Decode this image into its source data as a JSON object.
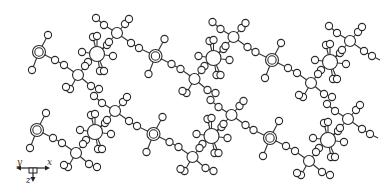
{
  "diagram": {
    "type": "crystal-structure-packing",
    "colors": {
      "stroke": "#2a2a2a",
      "fill": "#ffffff",
      "background": "#ffffff"
    },
    "repeat_offset": {
      "dx": 116.5,
      "dy": 4
    },
    "row_offset": {
      "dx": -2,
      "dy": 78
    },
    "units_per_row": 3,
    "rows": 2,
    "unit": {
      "metal_center": {
        "x": 39,
        "y": 52,
        "r_outer": 6.5,
        "r_inner": 4.2,
        "terminals": [
          {
            "x": 48,
            "y": 35
          },
          {
            "x": 32,
            "y": 70
          }
        ]
      },
      "bridge_to_junction": [
        {
          "x": 55,
          "y": 60
        },
        {
          "x": 64,
          "y": 65
        }
      ],
      "junction_lower": {
        "x": 78,
        "y": 75,
        "r": 5.5,
        "branches": [
          {
            "x": 70,
            "y": 89
          },
          {
            "x": 66,
            "y": 87
          },
          {
            "x": 91,
            "y": 86
          },
          {
            "x": 99,
            "y": 89
          }
        ]
      },
      "octahedral": {
        "x": 97,
        "y": 54,
        "r": 7.5,
        "ligands": [
          {
            "x": 93,
            "y": 37
          },
          {
            "x": 97,
            "y": 36
          },
          {
            "x": 82,
            "y": 52
          },
          {
            "x": 113,
            "y": 56
          },
          {
            "x": 100,
            "y": 71
          },
          {
            "x": 104,
            "y": 71
          },
          {
            "x": 88,
            "y": 62
          },
          {
            "x": 107,
            "y": 45
          }
        ]
      },
      "bridge_oct_to_junction": [
        {
          "x": 85,
          "y": 66
        },
        {
          "x": 109,
          "y": 42
        }
      ],
      "junction_upper": {
        "x": 117,
        "y": 33,
        "r": 5.5,
        "branches": [
          {
            "x": 96,
            "y": 18
          },
          {
            "x": 104,
            "y": 25
          },
          {
            "x": 125,
            "y": 24
          },
          {
            "x": 129,
            "y": 19
          }
        ]
      },
      "bridge_to_next_metal": [
        {
          "x": 131,
          "y": 43
        },
        {
          "x": 139,
          "y": 48
        }
      ]
    },
    "axes_legend": {
      "x": 33,
      "y": 168,
      "labels": {
        "x": "x",
        "y": "y",
        "z": "z"
      }
    }
  }
}
